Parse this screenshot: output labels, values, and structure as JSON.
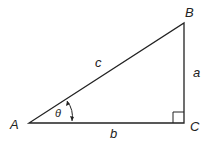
{
  "diagram": {
    "type": "right-triangle",
    "vertices": {
      "A": "A",
      "B": "B",
      "C": "C"
    },
    "sides": {
      "a": "a",
      "b": "b",
      "c": "c"
    },
    "angle": "θ",
    "right_angle_at": "C",
    "colors": {
      "stroke": "#222222",
      "background": "#ffffff"
    }
  }
}
